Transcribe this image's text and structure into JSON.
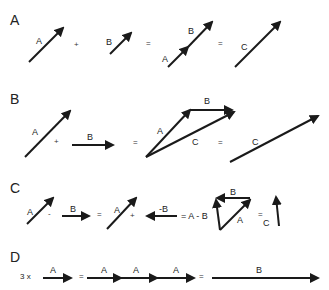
{
  "sections": [
    {
      "id": "A",
      "title": "A",
      "labels": [
        "A",
        "+",
        "B",
        "=",
        "B",
        "A",
        "=",
        "C"
      ]
    },
    {
      "id": "B",
      "title": "B",
      "labels": [
        "A",
        "+",
        "B",
        "=",
        "B",
        "A",
        "C",
        "=",
        "C"
      ]
    },
    {
      "id": "C",
      "title": "C",
      "labels": [
        "A",
        "-",
        "B",
        "=",
        "A",
        "+",
        "-B",
        "= A - B",
        "B",
        "A",
        "=",
        "C"
      ]
    },
    {
      "id": "D",
      "title": "D",
      "labels": [
        "3 x",
        "A",
        "=",
        "A",
        "A",
        "A",
        "=",
        "B"
      ]
    }
  ],
  "colors": {
    "arrow": "#1a1a1a",
    "text": "#222222",
    "background": "#ffffff"
  }
}
